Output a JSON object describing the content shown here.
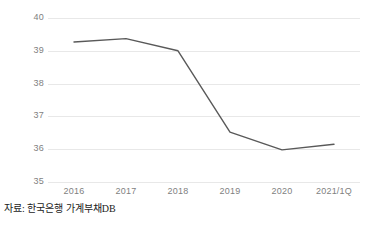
{
  "chart_data": {
    "type": "line",
    "title": "",
    "subtitle": "",
    "xlabel": "",
    "ylabel": "",
    "categories": [
      "2016",
      "2017",
      "2018",
      "2019",
      "2020",
      "2021/1Q"
    ],
    "series": [
      {
        "name": "",
        "values": [
          39.27,
          39.37,
          39.0,
          36.52,
          35.98,
          36.15
        ],
        "color": "#595959"
      }
    ],
    "ylim": [
      35,
      40
    ],
    "yticks": [
      40,
      39,
      38,
      37,
      36,
      35
    ],
    "ytick_labels": [
      "40",
      "39",
      "38",
      "37",
      "36",
      "35"
    ],
    "xtick_labels": [
      "2016",
      "2017",
      "2018",
      "2019",
      "2020",
      "2021/1Q"
    ],
    "grid": "horizontal",
    "grid_color": "#e8e8e8",
    "legend": "none",
    "markers": "none",
    "annotations": []
  },
  "source_note": {
    "text": "자료: 한국은행 가계부채DB"
  },
  "colors": {
    "line": "#595959",
    "grid": "#e8e8e8",
    "tick_text": "#7f7f7f",
    "note_text": "#1a1a1a",
    "background": "#ffffff"
  }
}
